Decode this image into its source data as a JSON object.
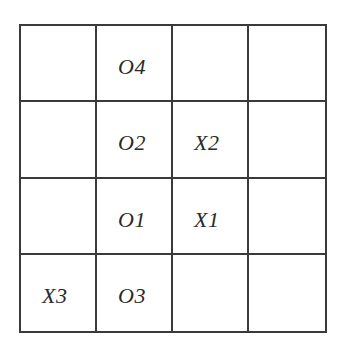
{
  "board": {
    "rows": 4,
    "cols": 4,
    "cells": [
      [
        "",
        "O4",
        "",
        ""
      ],
      [
        "",
        "O2",
        "X2",
        ""
      ],
      [
        "",
        "O1",
        "X1",
        ""
      ],
      [
        "X3",
        "O3",
        "",
        ""
      ]
    ]
  },
  "colors": {
    "grid_line": "#3a3a3a",
    "text": "#2a2a2a",
    "background": "#ffffff"
  }
}
